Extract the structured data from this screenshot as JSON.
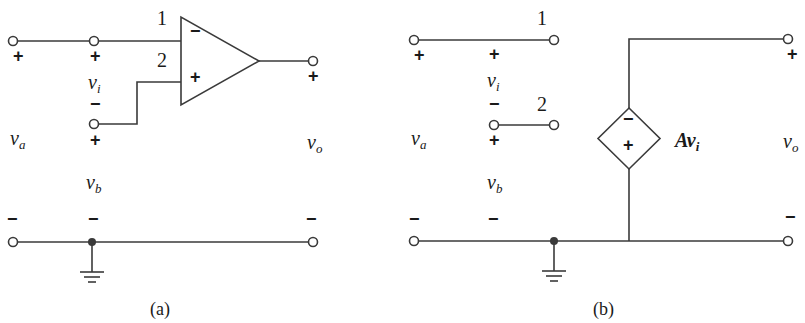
{
  "figure": {
    "panels": [
      {
        "id": "a",
        "caption": "(a)",
        "title": "Op-amp circuit",
        "terminal_labels": {
          "input1": "1",
          "input2": "2"
        },
        "opamp": {
          "inverting_sign": "−",
          "noninverting_sign": "+"
        },
        "voltages": {
          "va": {
            "base": "v",
            "sub": "a",
            "plus": "+",
            "minus": "−"
          },
          "vi": {
            "base": "v",
            "sub": "i",
            "plus": "+",
            "minus": "−"
          },
          "vb": {
            "base": "v",
            "sub": "b",
            "plus": "+",
            "minus": "−"
          },
          "vo": {
            "base": "v",
            "sub": "o",
            "plus": "+",
            "minus": "−"
          }
        }
      },
      {
        "id": "b",
        "caption": "(b)",
        "title": "Equivalent circuit with dependent voltage source",
        "terminal_labels": {
          "input1": "1",
          "input2": "2"
        },
        "source": {
          "top_sign": "−",
          "bottom_sign": "+",
          "gain_label": "A",
          "gain_var": "v",
          "gain_sub": "i"
        },
        "voltages": {
          "va": {
            "base": "v",
            "sub": "a",
            "plus": "+",
            "minus": "−"
          },
          "vi": {
            "base": "v",
            "sub": "i",
            "plus": "+",
            "minus": "−"
          },
          "vb": {
            "base": "v",
            "sub": "b",
            "plus": "+",
            "minus": "−"
          },
          "vo": {
            "base": "v",
            "sub": "o",
            "plus": "+",
            "minus": "−"
          }
        }
      }
    ],
    "colors": {
      "line": "#3a3a3a",
      "text": "#1a1a1a",
      "background": "#ffffff"
    }
  }
}
